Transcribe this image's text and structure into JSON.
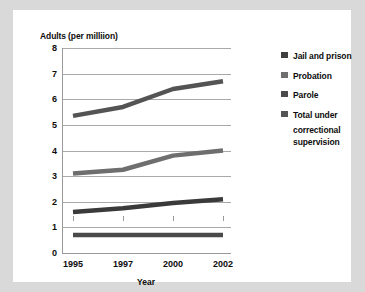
{
  "chart_data": {
    "type": "line",
    "title": "Adults (per milliion)",
    "xlabel": "Year",
    "ylabel": "Adults (per milliion)",
    "categories": [
      "1995",
      "1997",
      "2000",
      "2002"
    ],
    "ylim": [
      0,
      8
    ],
    "yticks": [
      "0",
      "1",
      "2",
      "3",
      "4",
      "5",
      "6",
      "7",
      "8"
    ],
    "grid": true,
    "legend_position": "right",
    "series": [
      {
        "name": "Jail and prison",
        "color": "#3a3a3a",
        "values": [
          1.6,
          1.75,
          1.95,
          2.1
        ]
      },
      {
        "name": "Probation",
        "color": "#6e6e6e",
        "values": [
          3.1,
          3.25,
          3.8,
          4.0
        ]
      },
      {
        "name": "Parole",
        "color": "#4a4a4a",
        "values": [
          0.7,
          0.7,
          0.7,
          0.7
        ]
      },
      {
        "name": "Total under correctional supervision",
        "color": "#545454",
        "values": [
          5.35,
          5.7,
          6.4,
          6.7
        ]
      }
    ]
  },
  "legend": {
    "items": [
      {
        "label": "Jail and prison",
        "swatch": "#3f3f3f"
      },
      {
        "label": "Probation",
        "swatch": "#6e6e6e"
      },
      {
        "label": "Parole",
        "swatch": "#4a4a4a"
      },
      {
        "label": "Total under",
        "swatch": "#545454"
      },
      {
        "label": "correctional",
        "swatch": null
      },
      {
        "label": "supervision",
        "swatch": null
      }
    ]
  },
  "colors": {
    "page_background": "#d9d9d9",
    "card_background": "#ffffff",
    "gridline": "#a9a9a9",
    "axis": "#9a9a9a",
    "text": "#0d0d0d"
  }
}
